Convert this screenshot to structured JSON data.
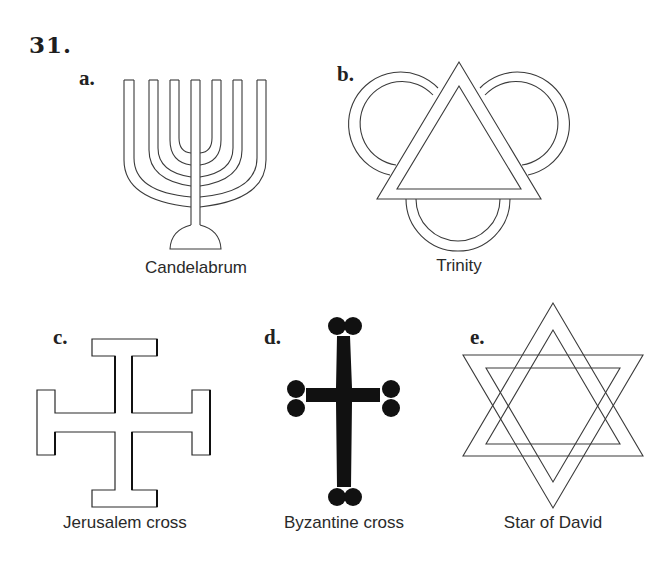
{
  "figure": {
    "number": "31.",
    "items": [
      {
        "letter": "a.",
        "caption": "Candelabrum",
        "symbol": "menorah-icon"
      },
      {
        "letter": "b.",
        "caption": "Trinity",
        "symbol": "trinity-icon"
      },
      {
        "letter": "c.",
        "caption": "Jerusalem cross",
        "symbol": "jerusalem-cross-icon"
      },
      {
        "letter": "d.",
        "caption": "Byzantine cross",
        "symbol": "byzantine-cross-icon"
      },
      {
        "letter": "e.",
        "caption": "Star of David",
        "symbol": "star-of-david-icon"
      }
    ]
  },
  "colors": {
    "line": "#3a3a3a",
    "fill_dark": "#111111",
    "background": "#ffffff"
  }
}
